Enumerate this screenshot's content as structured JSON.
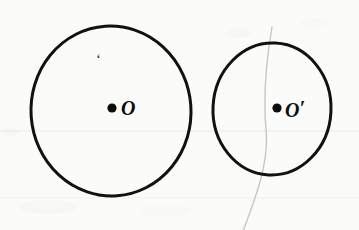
{
  "figure": {
    "background_color": "#fbfbf9",
    "ink_color": "#111111",
    "pencil_color": "#c9c6c2",
    "rule_line_color": "#ebe9e4",
    "width": 359,
    "height": 230
  },
  "shapes": {
    "left_circle": {
      "name": "circle-O",
      "center_x": 111,
      "center_y": 111,
      "radius_x": 80,
      "radius_y": 85,
      "stroke_width": 3,
      "stroke_color": "#111111",
      "fill": "none"
    },
    "right_circle": {
      "name": "circle-O-prime",
      "center_x": 272,
      "center_y": 109,
      "radius_x": 59,
      "radius_y": 66,
      "stroke_width": 3,
      "stroke_color": "#111111",
      "fill": "none"
    },
    "pencil_arc": {
      "name": "faint-pencil-arc",
      "stroke_color": "#c9c6c2",
      "stroke_width": 1.4,
      "path": "M 272,27 C 266,62 263,96 266,130 C 269,160 258,192 243,231"
    }
  },
  "points": {
    "center_left": {
      "label": "O",
      "dot_x": 112,
      "dot_y": 108,
      "dot_radius": 4.6,
      "dot_color": "#0d0d0d"
    },
    "center_right": {
      "label": "O",
      "prime": "′",
      "dot_x": 277,
      "dot_y": 108,
      "dot_radius": 4.6,
      "dot_color": "#0d0d0d"
    }
  },
  "annotations": {
    "stray_mark": "‘"
  },
  "paper": {
    "rule_lines": [
      {
        "y": 131,
        "color": "#ece9e3"
      },
      {
        "y": 198,
        "color": "#f3f1ec"
      }
    ],
    "smudges": [
      {
        "x": 18,
        "y": 200,
        "w": 60,
        "h": 14,
        "opacity": 0.05
      },
      {
        "x": 140,
        "y": 205,
        "w": 50,
        "h": 12,
        "opacity": 0.04
      },
      {
        "x": 225,
        "y": 28,
        "w": 26,
        "h": 10,
        "opacity": 0.05
      },
      {
        "x": 300,
        "y": 18,
        "w": 30,
        "h": 10,
        "opacity": 0.04
      }
    ]
  }
}
